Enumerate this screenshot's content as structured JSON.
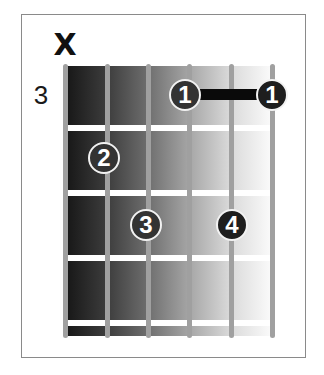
{
  "chord_diagram": {
    "starting_fret_label": "3",
    "string_markers": [
      {
        "string": 6,
        "marker": "X",
        "meaning": "muted"
      }
    ],
    "num_strings": 6,
    "num_frets_shown": 4,
    "fingers": [
      {
        "finger": "1",
        "string": 3,
        "fret": 1
      },
      {
        "finger": "1",
        "string": 1,
        "fret": 1
      },
      {
        "finger": "2",
        "string": 5,
        "fret": 2
      },
      {
        "finger": "3",
        "string": 4,
        "fret": 3
      },
      {
        "finger": "4",
        "string": 2,
        "fret": 3
      }
    ],
    "barre": {
      "finger": "1",
      "from_string": 3,
      "to_string": 1,
      "fret": 1
    },
    "colors": {
      "dot_fill": "#333333",
      "dot_ring": "#f2f2f2",
      "string": "#a0a0a0",
      "fret": "#ffffff",
      "barre": "#0a0a0a",
      "gradient_start": "#161616",
      "gradient_end": "#fbfbfb"
    }
  }
}
